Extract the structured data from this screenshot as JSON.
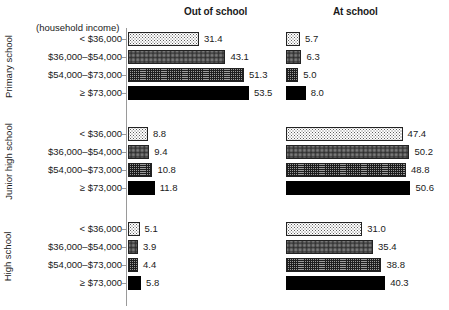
{
  "figure": {
    "income_caption": "(household income)",
    "column_headers": [
      "Out of school",
      "At school"
    ],
    "panels": [
      "Primary school",
      "Junior high school",
      "High school"
    ],
    "categories": [
      "< $36,000",
      "$36,000–$54,000",
      "$54,000–$73,000",
      "≥ $73,000"
    ]
  },
  "chart_data": {
    "type": "bar",
    "orientation": "horizontal",
    "title": "",
    "subtitle": "",
    "xlabel": "",
    "ylabel": "(household income)",
    "grid": false,
    "legend": "none",
    "axis_note": "Each panel column shares an independent horizontal scale starting at 0; bars are labelled with their values.",
    "categories": [
      "< $36,000",
      "$36,000–$54,000",
      "$54,000–$73,000",
      "≥ $73,000"
    ],
    "column_headers": [
      "Out of school",
      "At school"
    ],
    "panel_labels": [
      "Primary school",
      "Junior high school",
      "High school"
    ],
    "panels": [
      {
        "name": "Primary school",
        "series": [
          {
            "name": "Out of school",
            "categories": [
              "< $36,000",
              "$36,000–$54,000",
              "$54,000–$73,000",
              "≥ $73,000"
            ],
            "values": [
              31.4,
              43.1,
              51.3,
              53.5
            ]
          },
          {
            "name": "At school",
            "categories": [
              "< $36,000",
              "$36,000–$54,000",
              "$54,000–$73,000",
              "≥ $73,000"
            ],
            "values": [
              5.7,
              6.3,
              5.0,
              8.0
            ]
          }
        ]
      },
      {
        "name": "Junior high school",
        "series": [
          {
            "name": "Out of school",
            "categories": [
              "< $36,000",
              "$36,000–$54,000",
              "$54,000–$73,000",
              "≥ $73,000"
            ],
            "values": [
              8.8,
              9.4,
              10.8,
              11.8
            ]
          },
          {
            "name": "At school",
            "categories": [
              "< $36,000",
              "$36,000–$54,000",
              "$54,000–$73,000",
              "≥ $73,000"
            ],
            "values": [
              47.4,
              50.2,
              48.8,
              50.6
            ]
          }
        ]
      },
      {
        "name": "High school",
        "series": [
          {
            "name": "Out of school",
            "categories": [
              "< $36,000",
              "$36,000–$54,000",
              "$54,000–$73,000",
              "≥ $73,000"
            ],
            "values": [
              5.1,
              3.9,
              4.4,
              5.8
            ]
          },
          {
            "name": "At school",
            "categories": [
              "< $36,000",
              "$36,000–$54,000",
              "$54,000–$73,000",
              "≥ $73,000"
            ],
            "values": [
              31.0,
              35.4,
              38.8,
              40.3
            ]
          }
        ]
      }
    ],
    "value_labels": {
      "primary_out": [
        "31.4",
        "43.1",
        "51.3",
        "53.5"
      ],
      "primary_at": [
        "5.7",
        "6.3",
        "5.0",
        "8.0"
      ],
      "junior_out": [
        "8.8",
        "9.4",
        "10.8",
        "11.8"
      ],
      "junior_at": [
        "47.4",
        "50.2",
        "48.8",
        "50.6"
      ],
      "high_out": [
        "5.1",
        "3.9",
        "4.4",
        "5.8"
      ],
      "high_at": [
        "31.0",
        "35.4",
        "38.8",
        "40.3"
      ]
    },
    "fill_patterns": [
      "light-dotted",
      "dense-dotted",
      "crosshatch",
      "solid-black"
    ],
    "colors": {
      "ink": "#1a1a1a",
      "axis": "#9a9a9a",
      "bar_outline": "#222222",
      "solid_fill": "#000000",
      "background": "#ffffff"
    }
  },
  "layout": {
    "panel_tops": [
      32,
      127,
      222
    ],
    "row_pitch": 18,
    "bar_height": 14,
    "out_axis_x": 127,
    "at_axis_x": 285,
    "out_scale_px_per_unit": 2.26,
    "at_scale_px_per_unit": 2.46
  }
}
